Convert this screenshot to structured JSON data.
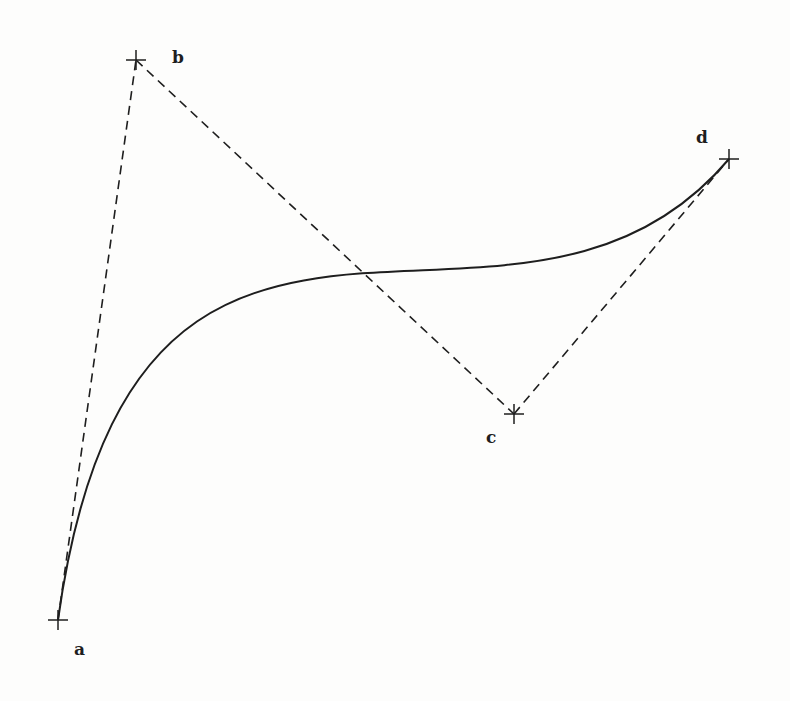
{
  "figure": {
    "type": "cubic-bezier-construction",
    "colors": {
      "background": "#fdfdfc",
      "ink": "#1e1e1e"
    },
    "control_points": [
      {
        "label": "a",
        "x": 58,
        "y": 620,
        "label_x": 74,
        "label_y": 655
      },
      {
        "label": "b",
        "x": 136,
        "y": 60,
        "label_x": 172,
        "label_y": 63
      },
      {
        "label": "c",
        "x": 514,
        "y": 414,
        "label_x": 486,
        "label_y": 443
      },
      {
        "label": "d",
        "x": 729,
        "y": 159,
        "label_x": 696,
        "label_y": 143
      }
    ],
    "control_polygon": {
      "style": "dashed",
      "segments": [
        "a-b",
        "b-c",
        "c-d"
      ]
    },
    "curve": {
      "style": "solid",
      "from": "a",
      "to": "d",
      "controls": [
        "b",
        "c"
      ]
    }
  }
}
